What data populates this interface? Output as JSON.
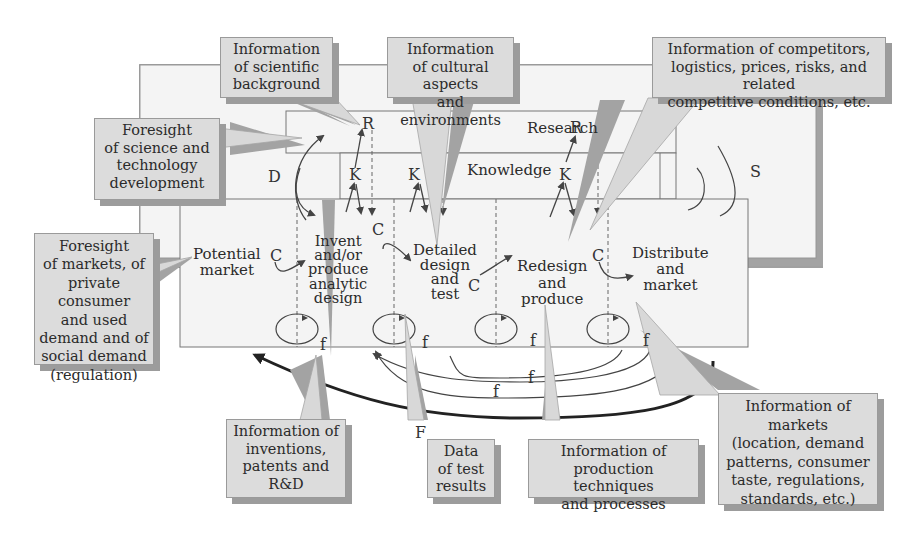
{
  "diagram": {
    "band_labels": {
      "research": "Research",
      "knowledge": "Knowledge",
      "d_label": "D",
      "s_label": "S",
      "big_f": "F"
    },
    "stages": [
      {
        "id": "potential-market",
        "lines": [
          "Potential",
          "market"
        ]
      },
      {
        "id": "invent",
        "lines": [
          "Invent",
          "and/or",
          "produce",
          "analytic",
          "design"
        ]
      },
      {
        "id": "detailed-design",
        "lines": [
          "Detailed",
          "design",
          "and",
          "test"
        ]
      },
      {
        "id": "redesign",
        "lines": [
          "Redesign",
          "and",
          "produce"
        ]
      },
      {
        "id": "distribute",
        "lines": [
          "Distribute",
          "and",
          "market"
        ]
      }
    ],
    "symbols": {
      "R": "R",
      "K": "K",
      "C": "C",
      "f": "f"
    },
    "callouts": [
      {
        "id": "scientific-background",
        "lines": [
          "Information",
          "of scientific",
          "background"
        ]
      },
      {
        "id": "cultural-aspects",
        "lines": [
          "Information",
          "of cultural aspects",
          "and environments"
        ]
      },
      {
        "id": "competitors",
        "lines": [
          "Information of competitors,",
          "logistics, prices, risks, and related",
          "competitive conditions, etc."
        ]
      },
      {
        "id": "foresight-science",
        "lines": [
          "Foresight",
          "of science and",
          "technology",
          "development"
        ]
      },
      {
        "id": "foresight-markets",
        "lines": [
          "Foresight",
          "of markets, of",
          "private consumer",
          "and used",
          "demand and of",
          "social demand",
          "(regulation)"
        ]
      },
      {
        "id": "inventions-patents",
        "lines": [
          "Information of",
          "inventions,",
          "patents and R&D"
        ]
      },
      {
        "id": "test-results",
        "lines": [
          "Data",
          "of test",
          "results"
        ]
      },
      {
        "id": "production-techniques",
        "lines": [
          "Information of",
          "production techniques",
          "and processes"
        ]
      },
      {
        "id": "markets-info",
        "lines": [
          "Information of markets",
          "(location, demand",
          "patterns, consumer",
          "taste, regulations,",
          "standards, etc.)"
        ]
      }
    ],
    "colors": {
      "callout_fill": "#dcdcdc",
      "callout_shadow": "#9c9c9c",
      "frame_fill": "#f2f2f2",
      "line": "#444444",
      "feedback_bold": "#222222"
    }
  }
}
